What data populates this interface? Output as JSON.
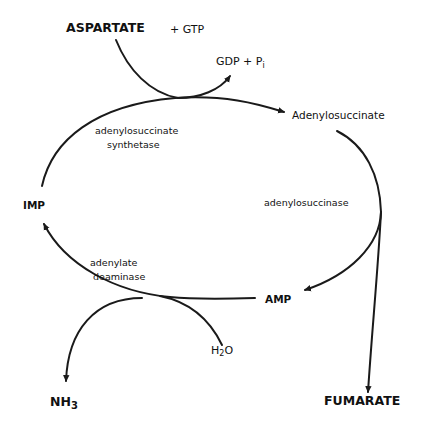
{
  "diagram": {
    "type": "metabolic-cycle",
    "title": "",
    "nodes": {
      "aspartate": "ASPARTATE",
      "gtp": "+ GTP",
      "gdp_pi_main": "GDP + P",
      "gdp_pi_sub": "i",
      "adenylosuccinate": "Adenylosuccinate",
      "imp": "IMP",
      "amp": "AMP",
      "h2o_h": "H",
      "h2o_2": "2",
      "h2o_o": "O",
      "nh3_main": "NH",
      "nh3_sub": "3",
      "fumarate": "FUMARATE"
    },
    "enzymes": {
      "synthetase_line1": "adenylosuccinate",
      "synthetase_line2": "synthetase",
      "adenylosuccinase": "adenylosuccinase",
      "deaminase_line1": "adenylate",
      "deaminase_line2": "deaminase"
    },
    "edges": [
      {
        "from": "IMP",
        "to": "Adenylosuccinate",
        "enzyme": "adenylosuccinate synthetase",
        "inputs": [
          "ASPARTATE",
          "GTP"
        ],
        "outputs": [
          "GDP",
          "Pi"
        ]
      },
      {
        "from": "Adenylosuccinate",
        "to": "AMP",
        "enzyme": "adenylosuccinase",
        "outputs": [
          "FUMARATE"
        ]
      },
      {
        "from": "AMP",
        "to": "IMP",
        "enzyme": "adenylate deaminase",
        "inputs": [
          "H2O"
        ],
        "outputs": [
          "NH3"
        ]
      }
    ],
    "colors": {
      "stroke": "#1a1a1a",
      "background": "#ffffff"
    }
  }
}
